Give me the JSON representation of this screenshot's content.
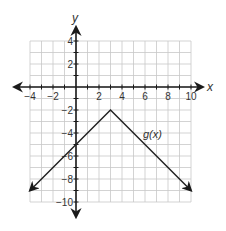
{
  "chart_data": {
    "type": "line",
    "title": "",
    "xlabel": "x",
    "ylabel": "y",
    "xlim": [
      -4,
      10
    ],
    "ylim": [
      -10,
      4
    ],
    "grid": true,
    "x_ticks": [
      -4,
      -2,
      2,
      4,
      6,
      8,
      10
    ],
    "y_ticks": [
      4,
      2,
      -2,
      -4,
      -6,
      -8,
      -10
    ],
    "x_tick_labels": [
      "−4",
      "−2",
      "2",
      "4",
      "6",
      "8",
      "10"
    ],
    "y_tick_labels": [
      "4",
      "2",
      "−2",
      "−4",
      "−6",
      "−8",
      "−10"
    ],
    "series": [
      {
        "name": "g(x)",
        "label": "g(x)",
        "x": [
          -4,
          3,
          10
        ],
        "y": [
          -9,
          -2,
          -9
        ],
        "arrows_at_ends": true,
        "color": "#222222"
      }
    ],
    "annotations": [
      {
        "text": "g(x)",
        "x": 6.3,
        "y": -4.1
      }
    ],
    "key_points": {
      "vertex": [
        3,
        -2
      ],
      "y_intercept": [
        0,
        -5
      ]
    }
  },
  "labels": {
    "x_axis": "x",
    "y_axis": "y",
    "curve": "g(x)"
  },
  "colors": {
    "grid": "#c8c8c8",
    "axis": "#1a1a1a",
    "curve": "#222222",
    "text": "#333333"
  }
}
